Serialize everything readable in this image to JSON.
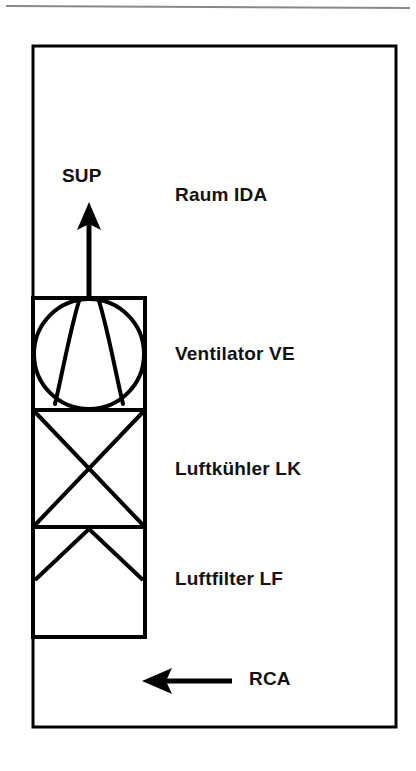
{
  "figure": {
    "type": "hvac-schematic",
    "background_color": "#ffffff",
    "line_color": "#000000"
  },
  "top_rule": {
    "name": "page-rule",
    "color": "#808080"
  },
  "room": {
    "label": "Raum IDA",
    "border_color": "#000000"
  },
  "components": [
    {
      "id": "fan",
      "label": "Ventilator VE",
      "symbol": "fan-symbol"
    },
    {
      "id": "cooler",
      "label": "Luftkühler LK",
      "symbol": "cooler-cross-symbol"
    },
    {
      "id": "filter",
      "label": "Luftfilter LF",
      "symbol": "filter-chevron-symbol"
    }
  ],
  "flows": [
    {
      "id": "supply",
      "label": "SUP",
      "direction": "up",
      "arrow_name": "supply-arrow-up"
    },
    {
      "id": "recirculation",
      "label": "RCA",
      "direction": "left",
      "arrow_name": "recirculation-arrow-left"
    }
  ]
}
